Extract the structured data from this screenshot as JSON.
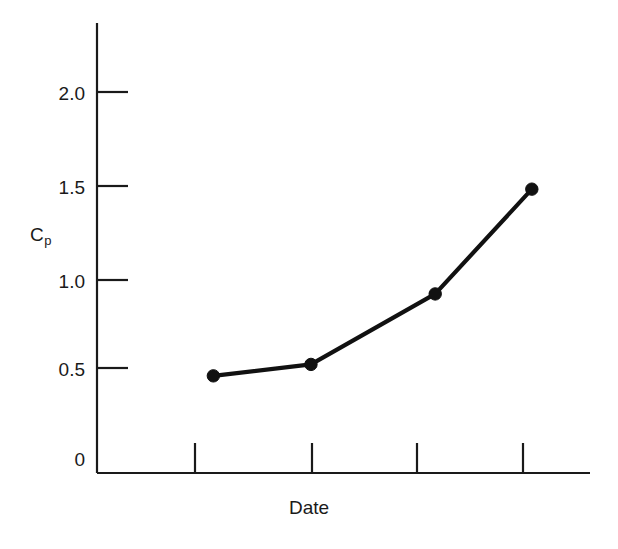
{
  "chart_data": {
    "type": "line",
    "title": "",
    "subtitle": "",
    "xlabel": "Date",
    "ylabel": "Cp",
    "ylabel_base": "C",
    "ylabel_sub": "p",
    "ylim": [
      0,
      2.3
    ],
    "yticks": [
      0,
      0.5,
      1.0,
      1.5,
      2.0
    ],
    "ytick_labels": [
      "0",
      "0.5",
      "1.0",
      "1.5",
      "2.0"
    ],
    "xlim": [
      0,
      5
    ],
    "xticks": [
      1,
      2,
      3,
      4
    ],
    "xtick_labels": [
      "",
      "",
      "",
      ""
    ],
    "grid": false,
    "legend": "none",
    "series": [
      {
        "name": "Cp",
        "color": "#111111",
        "marker": "filled-circle",
        "x": [
          1.18,
          2.17,
          3.43,
          4.41
        ],
        "values": [
          0.51,
          0.57,
          0.94,
          1.49
        ]
      }
    ],
    "annotations": []
  },
  "axes": {
    "y_tick_label_0": "0",
    "y_tick_label_1": "0.5",
    "y_tick_label_2": "1.0",
    "y_tick_label_3": "1.5",
    "y_tick_label_4": "2.0",
    "x_axis_title": "Date",
    "y_axis_title_base": "C",
    "y_axis_title_sub": "p"
  },
  "colors": {
    "background": "#ffffff",
    "axis": "#1a1a1a",
    "series": "#111111",
    "text": "#1a1a1a"
  }
}
